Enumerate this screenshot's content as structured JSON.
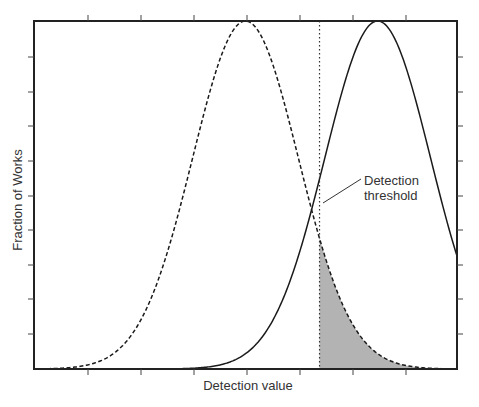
{
  "chart_data": {
    "type": "line",
    "title": "",
    "xlabel": "Detection value",
    "ylabel": "Fraction of Works",
    "grid": false,
    "legend": null,
    "x_ticks_unlabeled": 7,
    "y_ticks_unlabeled": 9,
    "xlim": [
      0,
      8
    ],
    "ylim": [
      0,
      1
    ],
    "series": [
      {
        "name": "Unmarked works",
        "style": "dashed",
        "distribution": "gaussian",
        "mean": 4.0,
        "sigma": 1.0,
        "peak": 1.0
      },
      {
        "name": "Watermarked works",
        "style": "solid",
        "distribution": "gaussian",
        "mean": 6.5,
        "sigma": 1.0,
        "peak": 1.0
      }
    ],
    "threshold": {
      "x": 5.4,
      "style": "dotted",
      "label": "Detection threshold"
    },
    "shaded_region": {
      "description": "Area under dashed curve to the right of threshold (false positives)",
      "from_x": 5.4,
      "color": "#b3b3b3"
    },
    "annotations": [
      {
        "text_lines": [
          "Detection",
          "threshold"
        ],
        "points_to": "threshold line"
      }
    ]
  },
  "labels": {
    "xlabel": "Detection value",
    "ylabel": "Fraction of Works",
    "annotation_line1": "Detection",
    "annotation_line2": "threshold"
  },
  "colors": {
    "axis": "#222222",
    "curve": "#1a1a1a",
    "shade": "#b3b3b3",
    "text": "#333333"
  }
}
